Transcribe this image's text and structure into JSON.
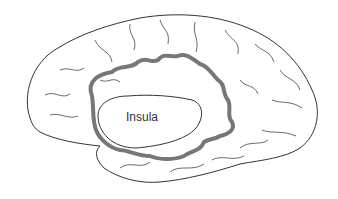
{
  "diagram": {
    "labels": [
      {
        "text": "Insula"
      }
    ],
    "colors": {
      "outline": "#333333",
      "operculum_ribbon": "#777777",
      "background": "#ffffff"
    }
  }
}
